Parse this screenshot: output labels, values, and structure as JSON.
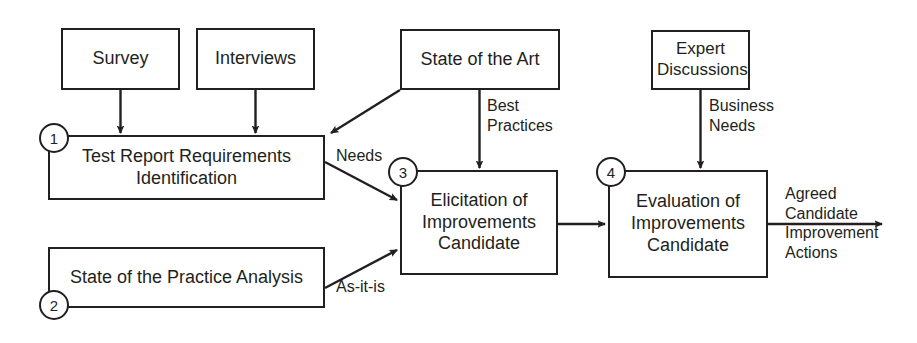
{
  "diagram": {
    "colors": {
      "stroke": "#231f20",
      "background": "#ffffff",
      "text": "#231f20"
    },
    "nodes": [
      {
        "id": "survey",
        "label": "Survey",
        "x": 61,
        "y": 28,
        "w": 119,
        "h": 62,
        "font_size": 18
      },
      {
        "id": "interviews",
        "label": "Interviews",
        "x": 196,
        "y": 28,
        "w": 119,
        "h": 62,
        "font_size": 18
      },
      {
        "id": "state-of-the-art",
        "label": "State of the Art",
        "x": 400,
        "y": 29,
        "w": 160,
        "h": 61,
        "font_size": 18
      },
      {
        "id": "expert-discussions",
        "label": "Expert\nDiscussions",
        "x": 651,
        "y": 30,
        "w": 99,
        "h": 60,
        "font_size": 17
      },
      {
        "id": "test-report-requirements-identification",
        "label": "Test Report Requirements\nIdentification",
        "x": 48,
        "y": 135,
        "w": 277,
        "h": 65,
        "font_size": 18
      },
      {
        "id": "state-of-the-practice-analysis",
        "label": "State of the Practice Analysis",
        "x": 48,
        "y": 247,
        "w": 277,
        "h": 61,
        "font_size": 18
      },
      {
        "id": "elicitation-of-improvements-candidate",
        "label": "Elicitation of\nImprovements\nCandidate",
        "x": 400,
        "y": 170,
        "w": 158,
        "h": 105,
        "font_size": 18
      },
      {
        "id": "evaluation-of-improvements-candidate",
        "label": "Evaluation of\nImprovements\nCandidate",
        "x": 608,
        "y": 170,
        "w": 160,
        "h": 108,
        "font_size": 18
      }
    ],
    "steps": [
      {
        "id": "step-1",
        "number": "1",
        "cx": 54,
        "cy": 138
      },
      {
        "id": "step-2",
        "number": "2",
        "cx": 54,
        "cy": 305
      },
      {
        "id": "step-3",
        "number": "3",
        "cx": 403,
        "cy": 172
      },
      {
        "id": "step-4",
        "number": "4",
        "cx": 611,
        "cy": 172
      }
    ],
    "edge_labels": [
      {
        "id": "needs",
        "text": "Needs",
        "x": 336,
        "y": 146,
        "font_size": 16,
        "align": "left"
      },
      {
        "id": "as-it-is",
        "text": "As-it-is",
        "x": 336,
        "y": 277,
        "font_size": 16,
        "align": "left"
      },
      {
        "id": "best-practices",
        "text": "Best\nPractices",
        "x": 487,
        "y": 96,
        "font_size": 16,
        "align": "left"
      },
      {
        "id": "business-needs",
        "text": "Business\nNeeds",
        "x": 709,
        "y": 96,
        "font_size": 16,
        "align": "left"
      },
      {
        "id": "agreed-candidate-improvement-actions",
        "text": "Agreed\nCandidate\nImprovement\nActions",
        "x": 785,
        "y": 184,
        "font_size": 16,
        "align": "left"
      }
    ],
    "edges": [
      {
        "id": "survey-to-requirements",
        "from": "survey",
        "to": "test-report-requirements-identification",
        "kind": "vertical-arrow"
      },
      {
        "id": "interviews-to-requirements",
        "from": "interviews",
        "to": "test-report-requirements-identification",
        "kind": "vertical-arrow"
      },
      {
        "id": "state-of-art-to-requirements",
        "from": "state-of-the-art",
        "to": "test-report-requirements-identification",
        "kind": "diagonal-arrow",
        "label": ""
      },
      {
        "id": "requirements-to-elicitation",
        "from": "test-report-requirements-identification",
        "to": "elicitation-of-improvements-candidate",
        "kind": "diagonal-arrow",
        "label": "Needs"
      },
      {
        "id": "practice-to-elicitation",
        "from": "state-of-the-practice-analysis",
        "to": "elicitation-of-improvements-candidate",
        "kind": "diagonal-arrow",
        "label": "As-it-is"
      },
      {
        "id": "state-of-art-to-elicitation",
        "from": "state-of-the-art",
        "to": "elicitation-of-improvements-candidate",
        "kind": "vertical-arrow",
        "label": "Best Practices"
      },
      {
        "id": "elicitation-to-evaluation",
        "from": "elicitation-of-improvements-candidate",
        "to": "evaluation-of-improvements-candidate",
        "kind": "horizontal-arrow"
      },
      {
        "id": "expert-to-evaluation",
        "from": "expert-discussions",
        "to": "evaluation-of-improvements-candidate",
        "kind": "vertical-arrow",
        "label": "Business Needs"
      },
      {
        "id": "evaluation-to-output",
        "from": "evaluation-of-improvements-candidate",
        "to": "output",
        "kind": "horizontal-arrow",
        "label": "Agreed Candidate Improvement Actions"
      }
    ]
  }
}
